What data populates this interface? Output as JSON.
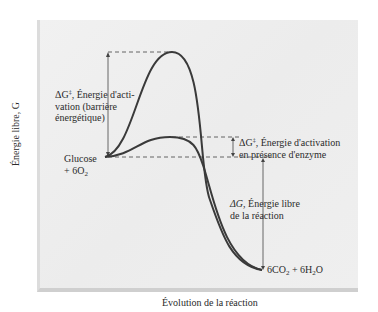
{
  "diagram": {
    "title": "",
    "axes": {
      "y_label": "Énergie libre, G",
      "x_label": "Évolution de la réaction"
    },
    "reactants": {
      "line1": "Glucose",
      "line2_prefix": "+ 6O",
      "line2_sub": "2"
    },
    "products": {
      "co2_prefix": "6CO",
      "co2_sub": "2",
      "h2o_prefix": " + 6H",
      "h2o_sub": "2",
      "h2o_suffix": "O"
    },
    "annotations": {
      "uncatalyzed": {
        "symbol": "ΔG",
        "dagger": "‡",
        "line1_rest": ", Énergie d'acti-",
        "line2": "vation (barrière",
        "line3": "énergétique)"
      },
      "catalyzed": {
        "symbol": "ΔG",
        "dagger": "‡",
        "line1_rest": ", Énergie d'activation",
        "line2": "en présence d'enzyme"
      },
      "reaction": {
        "symbol": "ΔG",
        "line1_rest": ", Énergie libre",
        "line2": "de la réaction"
      }
    },
    "curves": [
      {
        "name": "uncatalyzed",
        "description": "Tall activation barrier without enzyme"
      },
      {
        "name": "catalyzed",
        "description": "Lower activation barrier in presence of enzyme"
      }
    ],
    "colors": {
      "curve": "#3a3a3a",
      "panel": "#eeeeee",
      "dash": "#555555"
    }
  }
}
